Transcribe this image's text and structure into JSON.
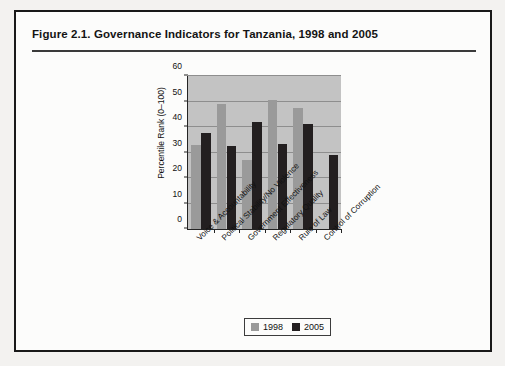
{
  "figure": {
    "title": "Figure 2.1.  Governance Indicators for Tanzania, 1998 and 2005"
  },
  "chart_data": {
    "type": "bar",
    "title": "Governance Indicators for Tanzania, 1998 and 2005",
    "xlabel": "",
    "ylabel": "Percentile Rank (0–100)",
    "ylim": [
      0,
      60
    ],
    "yticks": [
      0,
      10,
      20,
      30,
      40,
      50,
      60
    ],
    "ytick_labels": [
      "0",
      "10",
      "20",
      "30",
      "40",
      "50",
      "60"
    ],
    "grid": true,
    "legend_position": "bottom",
    "categories": [
      "Voice & Accountability",
      "Political Stability/No Violence",
      "Government Effectiveness",
      "Regulatory Quality",
      "Rule of Law",
      "Control of Corruption"
    ],
    "series": [
      {
        "name": "1998",
        "color": "#9a9a9a",
        "values": [
          33,
          49,
          27,
          50.5,
          47.5,
          0
        ]
      },
      {
        "name": "2005",
        "color": "#231f20",
        "values": [
          37.5,
          32.5,
          42,
          33.5,
          41,
          29
        ]
      }
    ]
  },
  "legend": {
    "items": [
      {
        "label": "1998",
        "color": "#9a9a9a"
      },
      {
        "label": "2005",
        "color": "#231f20"
      }
    ]
  }
}
